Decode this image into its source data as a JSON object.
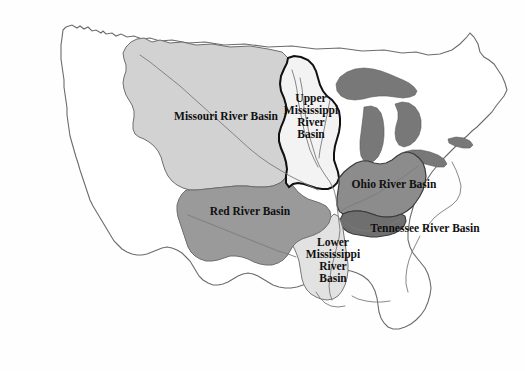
{
  "figure": {
    "kind": "thematic-map",
    "background_color": "#ffffff"
  },
  "map": {
    "country_outline_color": "#5a5a5a",
    "basin_outline_color": "#111111",
    "river_line_color": "#707070",
    "great_lakes_color": "#787878"
  },
  "basins": [
    {
      "id": "missouri",
      "label": "Missouri River Basin",
      "fill": "#d2d2d2",
      "stroke": "#6e6e6e",
      "label_lines": "Missouri River Basin"
    },
    {
      "id": "upper-mississippi",
      "label": "Upper Mississippi River Basin",
      "fill": "#f3f3f3",
      "stroke": "#111111",
      "label_lines": "Upper\nMississippi\nRiver\nBasin"
    },
    {
      "id": "ohio",
      "label": "Ohio River Basin",
      "fill": "#8c8c8c",
      "stroke": "#3a3a3a",
      "label_lines": "Ohio River Basin"
    },
    {
      "id": "tennessee",
      "label": "Tennessee River Basin",
      "fill": "#6f6f6f",
      "stroke": "#3a3a3a",
      "label_lines": "Tennessee River Basin"
    },
    {
      "id": "red",
      "label": "Red River Basin",
      "fill": "#9a9a9a",
      "stroke": "#6e6e6e",
      "label_lines": "Red River Basin"
    },
    {
      "id": "lower-mississippi",
      "label": "Lower Mississippi River Basin",
      "fill": "#e2e2e2",
      "stroke": "#777777",
      "label_lines": "Lower\nMississippi\nRiver\nBasin"
    }
  ]
}
